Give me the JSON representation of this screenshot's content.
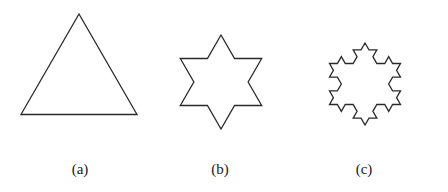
{
  "figure": {
    "stroke_color": "#2a2a2a",
    "stroke_width": 1.3,
    "panels": [
      {
        "id": "a",
        "label": "(a)",
        "iterations": 0,
        "center": [
          79,
          81
        ],
        "radius": 67,
        "label_pos": [
          80,
          161
        ]
      },
      {
        "id": "b",
        "label": "(b)",
        "iterations": 1,
        "center": [
          221,
          82
        ],
        "radius": 47,
        "label_pos": [
          220,
          161
        ]
      },
      {
        "id": "c",
        "label": "(c)",
        "iterations": 2,
        "center": [
          365,
          84
        ],
        "radius": 41,
        "label_pos": [
          364,
          161
        ]
      }
    ]
  }
}
